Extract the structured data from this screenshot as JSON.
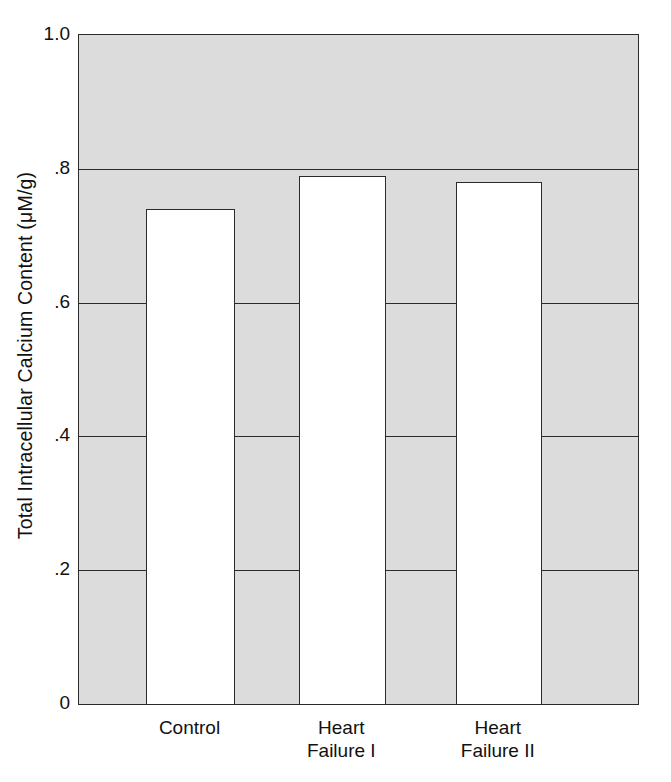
{
  "chart_data": {
    "type": "bar",
    "title": "",
    "subtitle": "",
    "xlabel": "",
    "ylabel": "Total Intracellular Calcium Content (μM/g)",
    "categories": [
      "Control",
      "Heart\nFailure I",
      "Heart\nFailure II"
    ],
    "values": [
      0.74,
      0.79,
      0.78
    ],
    "series": [
      {
        "name": "Total Intracellular Calcium Content",
        "values": [
          0.74,
          0.79,
          0.78
        ]
      }
    ],
    "ylim": [
      0,
      1.0
    ],
    "yticks": [
      0,
      0.2,
      0.4,
      0.6,
      0.8,
      1.0
    ],
    "ytick_labels": [
      "0",
      ".2",
      ".4",
      ".6",
      ".8",
      "1.0"
    ],
    "grid": true,
    "grid_axis": "y",
    "legend": false,
    "legend_position": "none",
    "annotations": [],
    "colors": {
      "plot_background": "#dcdcdc",
      "bar_fill": "#ffffff",
      "bar_edge": "#2b2b2b",
      "axis": "#2b2b2b",
      "gridline": "#2b2b2b",
      "text": "#111111",
      "page_background": "#ffffff"
    }
  }
}
